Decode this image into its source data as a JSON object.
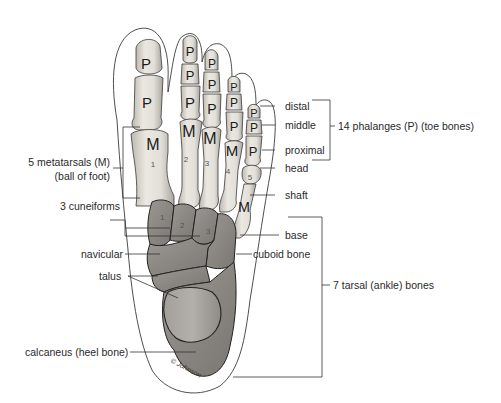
{
  "diagram": {
    "labels_left": {
      "metatarsals_line1": "5 metatarsals (M)",
      "metatarsals_line2": "(ball of foot)",
      "cuneiforms": "3 cuneiforms",
      "navicular": "navicular",
      "talus": "talus",
      "calcaneus": "calcaneus (heel bone)"
    },
    "labels_right": {
      "distal": "distal",
      "middle": "middle",
      "proximal": "proximal",
      "head": "head",
      "shaft": "shaft",
      "base": "base",
      "cuboid": "cuboid bone"
    },
    "group_labels": {
      "phalanges": "14 phalanges (P) (toe bones)",
      "tarsals": "7 tarsal (ankle) bones"
    },
    "bone_letters": {
      "phalanx": "P",
      "metatarsal": "M"
    },
    "metatarsal_numbers": [
      "1",
      "2",
      "3",
      "4",
      "5"
    ],
    "cuneiform_numbers": [
      "1",
      "2",
      "3"
    ],
    "signature": "© Johnson",
    "colors": {
      "bone_light": "#e6e3dc",
      "bone_shade": "#b9b5ad",
      "tarsal_dark": "#8e8b86",
      "tarsal_mid": "#a6a39e",
      "outline": "#3a3a3a",
      "line": "#333333",
      "text": "#2a2a2a"
    }
  }
}
